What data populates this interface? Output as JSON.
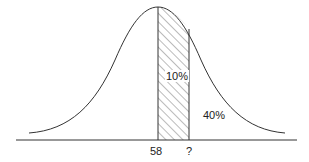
{
  "diagram": {
    "type": "normal-distribution",
    "mean_label": "58",
    "unknown_label": "?",
    "shaded_region_label": "10%",
    "right_tail_label": "40%",
    "colors": {
      "line": "#333333",
      "hatch": "#555555",
      "background": "#ffffff"
    }
  }
}
